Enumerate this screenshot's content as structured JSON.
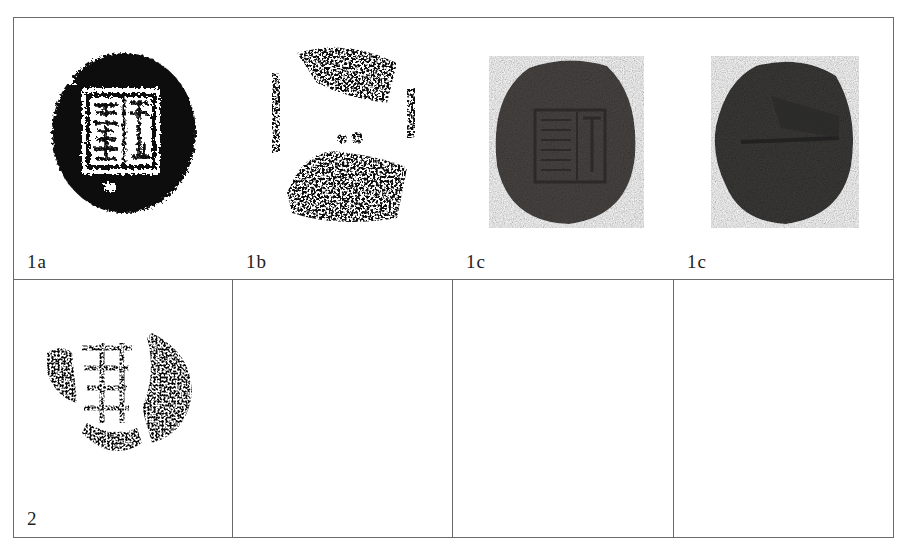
{
  "figure": {
    "rows": [
      {
        "cells": [
          {
            "label": "1a",
            "image": "black seal rubbing with rectangular inscribed frame, two columns of characters",
            "style": "rubbing-solid"
          },
          {
            "label": "1b",
            "image": "fragmentary seal rubbing, speckled",
            "style": "rubbing-fragment"
          },
          {
            "label": "1c",
            "image": "clay sealing photograph, obverse with stamped rectangular inscription",
            "style": "photo-obverse"
          },
          {
            "label": "1c",
            "image": "clay sealing photograph, reverse with string groove",
            "style": "photo-reverse"
          }
        ]
      },
      {
        "cells": [
          {
            "label": "2",
            "image": "fragmentary heart-shaped seal rubbing with inscription",
            "style": "rubbing-fragment"
          },
          {
            "label": "",
            "image": ""
          },
          {
            "label": "",
            "image": ""
          },
          {
            "label": "",
            "image": ""
          }
        ]
      }
    ],
    "colors": {
      "border": "#6a6a6a",
      "ink": "#111111",
      "clay_obverse": "#4a4644",
      "clay_reverse": "#3c3a39",
      "label": "#222222"
    }
  }
}
